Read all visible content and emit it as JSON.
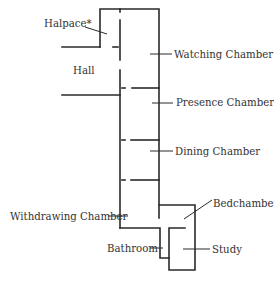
{
  "diagram": {
    "type": "floor-plan",
    "labels": {
      "halpace": "Halpace*",
      "hall": "Hall",
      "watching_chamber": "Watching Chamber",
      "presence_chamber": "Presence Chamber",
      "dining_chamber": "Dining Chamber",
      "withdrawing_chamber": "Withdrawing Chamber",
      "bedchamber": "Bedchamber",
      "bathroom": "Bathroom",
      "study": "Study"
    },
    "colors": {
      "line": "#2a2a2a",
      "text": "#333333",
      "background": "#ffffff"
    }
  }
}
